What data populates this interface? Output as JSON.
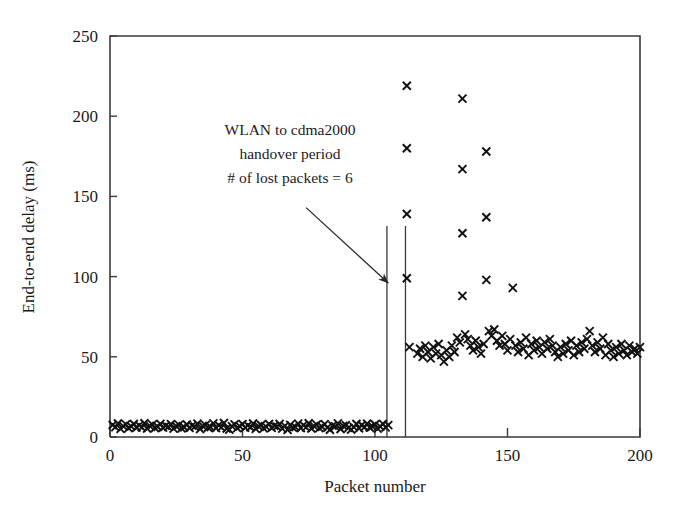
{
  "figure": {
    "background": "#ffffff",
    "ink_color": "#1a1a1a",
    "marker_symbol": "x",
    "marker_color": "#111111"
  },
  "chart_data": {
    "type": "scatter",
    "title": "",
    "xlabel": "Packet number",
    "ylabel": "End-to-end delay (ms)",
    "xlim": [
      0,
      200
    ],
    "ylim": [
      0,
      250
    ],
    "xticks": [
      0,
      50,
      100,
      150,
      200
    ],
    "yticks": [
      0,
      50,
      100,
      150,
      200,
      250
    ],
    "grid": false,
    "legend": "none",
    "series": [
      {
        "name": "End-to-end delay",
        "marker": "x",
        "color": "#111111",
        "points": [
          [
            1,
            7.5
          ],
          [
            2,
            6.2
          ],
          [
            3,
            8.4
          ],
          [
            4,
            5.1
          ],
          [
            5,
            6.8
          ],
          [
            6,
            7.9
          ],
          [
            7,
            5.5
          ],
          [
            8,
            6.6
          ],
          [
            9,
            8.1
          ],
          [
            10,
            5.9
          ],
          [
            11,
            7.2
          ],
          [
            12,
            6.0
          ],
          [
            13,
            8.6
          ],
          [
            14,
            5.3
          ],
          [
            15,
            6.9
          ],
          [
            16,
            7.7
          ],
          [
            17,
            5.6
          ],
          [
            18,
            6.4
          ],
          [
            19,
            8.2
          ],
          [
            20,
            5.8
          ],
          [
            21,
            7.0
          ],
          [
            22,
            6.3
          ],
          [
            23,
            8.0
          ],
          [
            24,
            5.2
          ],
          [
            25,
            6.7
          ],
          [
            26,
            7.6
          ],
          [
            27,
            5.4
          ],
          [
            28,
            6.1
          ],
          [
            29,
            7.8
          ],
          [
            30,
            5.7
          ],
          [
            31,
            7.1
          ],
          [
            32,
            6.5
          ],
          [
            33,
            8.3
          ],
          [
            34,
            5.0
          ],
          [
            35,
            6.9
          ],
          [
            36,
            7.4
          ],
          [
            37,
            5.9
          ],
          [
            38,
            6.2
          ],
          [
            39,
            8.5
          ],
          [
            40,
            5.6
          ],
          [
            41,
            7.3
          ],
          [
            42,
            6.0
          ],
          [
            43,
            8.7
          ],
          [
            44,
            5.3
          ],
          [
            45,
            4.6
          ],
          [
            46,
            6.8
          ],
          [
            47,
            7.9
          ],
          [
            48,
            5.5
          ],
          [
            49,
            6.6
          ],
          [
            50,
            8.0
          ],
          [
            51,
            5.8
          ],
          [
            52,
            7.2
          ],
          [
            53,
            6.1
          ],
          [
            54,
            8.4
          ],
          [
            55,
            5.1
          ],
          [
            56,
            6.7
          ],
          [
            57,
            7.5
          ],
          [
            58,
            5.4
          ],
          [
            59,
            6.3
          ],
          [
            60,
            8.1
          ],
          [
            61,
            5.7
          ],
          [
            62,
            7.0
          ],
          [
            63,
            6.5
          ],
          [
            64,
            8.2
          ],
          [
            65,
            5.2
          ],
          [
            66,
            6.9
          ],
          [
            67,
            4.4
          ],
          [
            68,
            7.6
          ],
          [
            69,
            5.9
          ],
          [
            70,
            6.2
          ],
          [
            71,
            8.3
          ],
          [
            72,
            5.6
          ],
          [
            73,
            7.4
          ],
          [
            74,
            6.0
          ],
          [
            75,
            8.6
          ],
          [
            76,
            5.3
          ],
          [
            77,
            6.8
          ],
          [
            78,
            7.7
          ],
          [
            79,
            5.5
          ],
          [
            80,
            6.4
          ],
          [
            81,
            8.0
          ],
          [
            82,
            5.8
          ],
          [
            83,
            4.5
          ],
          [
            84,
            7.1
          ],
          [
            85,
            6.6
          ],
          [
            86,
            8.5
          ],
          [
            87,
            5.0
          ],
          [
            88,
            6.9
          ],
          [
            89,
            7.3
          ],
          [
            90,
            5.7
          ],
          [
            91,
            4.7
          ],
          [
            92,
            6.2
          ],
          [
            93,
            8.1
          ],
          [
            94,
            5.4
          ],
          [
            95,
            7.5
          ],
          [
            96,
            6.1
          ],
          [
            97,
            8.3
          ],
          [
            98,
            5.9
          ],
          [
            99,
            6.7
          ],
          [
            100,
            7.8
          ],
          [
            101,
            5.2
          ],
          [
            102,
            6.5
          ],
          [
            103,
            8.2
          ],
          [
            104,
            6.0
          ],
          [
            105,
            7.4
          ],
          [
            112,
            219
          ],
          [
            112,
            180
          ],
          [
            112,
            139
          ],
          [
            112,
            99
          ],
          [
            113,
            56
          ],
          [
            116,
            52
          ],
          [
            117,
            55
          ],
          [
            118,
            50
          ],
          [
            119,
            57
          ],
          [
            120,
            53
          ],
          [
            121,
            49
          ],
          [
            122,
            56
          ],
          [
            123,
            52
          ],
          [
            124,
            58
          ],
          [
            125,
            51
          ],
          [
            126,
            47
          ],
          [
            127,
            54
          ],
          [
            128,
            50
          ],
          [
            129,
            57
          ],
          [
            130,
            53
          ],
          [
            131,
            62
          ],
          [
            132,
            59
          ],
          [
            133,
            211
          ],
          [
            133,
            167
          ],
          [
            133,
            127
          ],
          [
            133,
            88
          ],
          [
            134,
            64
          ],
          [
            135,
            61
          ],
          [
            136,
            57
          ],
          [
            137,
            54
          ],
          [
            138,
            60
          ],
          [
            139,
            56
          ],
          [
            140,
            52
          ],
          [
            141,
            58
          ],
          [
            142,
            178
          ],
          [
            142,
            137
          ],
          [
            142,
            98
          ],
          [
            143,
            66
          ],
          [
            144,
            63
          ],
          [
            145,
            67
          ],
          [
            146,
            60
          ],
          [
            147,
            57
          ],
          [
            148,
            63
          ],
          [
            149,
            58
          ],
          [
            150,
            54
          ],
          [
            151,
            61
          ],
          [
            152,
            93
          ],
          [
            153,
            57
          ],
          [
            154,
            53
          ],
          [
            155,
            59
          ],
          [
            156,
            55
          ],
          [
            157,
            62
          ],
          [
            158,
            51
          ],
          [
            159,
            58
          ],
          [
            160,
            54
          ],
          [
            161,
            60
          ],
          [
            162,
            56
          ],
          [
            163,
            52
          ],
          [
            164,
            59
          ],
          [
            165,
            55
          ],
          [
            166,
            61
          ],
          [
            167,
            57
          ],
          [
            168,
            53
          ],
          [
            169,
            50
          ],
          [
            170,
            56
          ],
          [
            171,
            52
          ],
          [
            172,
            58
          ],
          [
            173,
            54
          ],
          [
            174,
            60
          ],
          [
            175,
            51
          ],
          [
            176,
            57
          ],
          [
            177,
            53
          ],
          [
            178,
            59
          ],
          [
            179,
            55
          ],
          [
            180,
            61
          ],
          [
            181,
            66
          ],
          [
            182,
            57
          ],
          [
            183,
            53
          ],
          [
            184,
            59
          ],
          [
            185,
            55
          ],
          [
            186,
            62
          ],
          [
            187,
            51
          ],
          [
            188,
            58
          ],
          [
            189,
            54
          ],
          [
            190,
            50
          ],
          [
            191,
            56
          ],
          [
            192,
            52
          ],
          [
            193,
            58
          ],
          [
            194,
            54
          ],
          [
            195,
            51
          ],
          [
            196,
            57
          ],
          [
            197,
            53
          ],
          [
            198,
            55
          ],
          [
            199,
            52
          ],
          [
            200,
            56
          ]
        ]
      }
    ],
    "annotations": [
      {
        "name": "handover-annotation",
        "lines": [
          "WLAN to cdma2000",
          "handover period",
          "# of lost packets = 6"
        ],
        "arrow_from": [
          74,
          143
        ],
        "arrow_to": [
          105,
          96
        ]
      }
    ],
    "vertical_markers": [
      {
        "name": "handover-start-line",
        "x": 104.5
      },
      {
        "name": "handover-end-line",
        "x": 111.5
      }
    ]
  }
}
